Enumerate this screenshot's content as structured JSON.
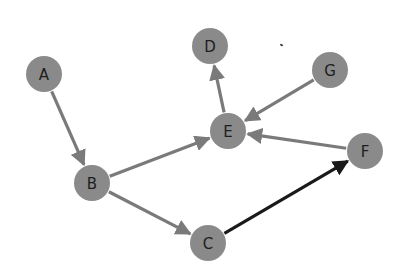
{
  "diagram": {
    "type": "directed-graph",
    "colors": {
      "node_fill": "#8a8a8a",
      "edge": "#7a7a7a",
      "highlight_edge": "#1a1a1a",
      "label": "#1e1e1e"
    },
    "nodes": [
      {
        "id": "A",
        "label": "A",
        "x": 44,
        "y": 74
      },
      {
        "id": "B",
        "label": "B",
        "x": 92,
        "y": 183
      },
      {
        "id": "C",
        "label": "C",
        "x": 208,
        "y": 243
      },
      {
        "id": "D",
        "label": "D",
        "x": 210,
        "y": 46
      },
      {
        "id": "E",
        "label": "E",
        "x": 228,
        "y": 131
      },
      {
        "id": "F",
        "label": "F",
        "x": 365,
        "y": 151
      },
      {
        "id": "G",
        "label": "G",
        "x": 330,
        "y": 70
      }
    ],
    "edges": [
      {
        "from": "A",
        "to": "B",
        "highlighted": false
      },
      {
        "from": "B",
        "to": "E",
        "highlighted": false
      },
      {
        "from": "B",
        "to": "C",
        "highlighted": false
      },
      {
        "from": "E",
        "to": "D",
        "highlighted": false
      },
      {
        "from": "G",
        "to": "E",
        "highlighted": false
      },
      {
        "from": "F",
        "to": "E",
        "highlighted": false
      },
      {
        "from": "C",
        "to": "F",
        "highlighted": true
      }
    ]
  }
}
